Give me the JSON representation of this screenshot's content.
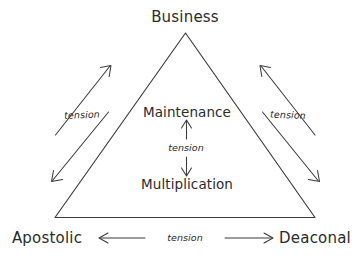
{
  "diagram": {
    "type": "triangle-tension-diagram",
    "background_color": "#ffffff",
    "stroke_color": "#3a3a3a",
    "text_color": "#2b2b2b",
    "corners": [
      {
        "id": "top",
        "label": "Business"
      },
      {
        "id": "bottom-left",
        "label": "Apostolic"
      },
      {
        "id": "bottom-right",
        "label": "Deaconal"
      }
    ],
    "center_nodes": [
      {
        "id": "maintenance",
        "label": "Maintenance"
      },
      {
        "id": "multiplication",
        "label": "Multiplication"
      }
    ],
    "relations": [
      {
        "id": "left-edge",
        "label": "tension",
        "between": [
          "Business",
          "Apostolic"
        ]
      },
      {
        "id": "right-edge",
        "label": "tension",
        "between": [
          "Business",
          "Deaconal"
        ]
      },
      {
        "id": "bottom-edge",
        "label": "tension",
        "between": [
          "Apostolic",
          "Deaconal"
        ]
      },
      {
        "id": "center-axis",
        "label": "tension",
        "between": [
          "Maintenance",
          "Multiplication"
        ]
      }
    ]
  }
}
